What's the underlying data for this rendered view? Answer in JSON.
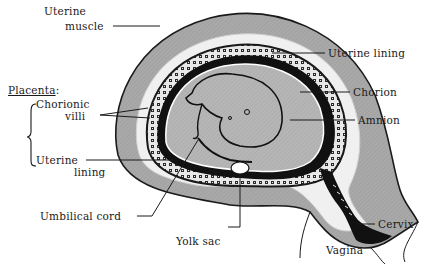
{
  "diagram": {
    "colors": {
      "background": "#ffffff",
      "muscle_gray": "#a8a8a8",
      "lining_white": "#f2f2f2",
      "outline": "#1a1a1a",
      "amniotic_gray": "#b4b4b4"
    },
    "labels": {
      "uterine_muscle_1": "Uterine",
      "uterine_muscle_2": "muscle",
      "uterine_lining_top": "Uterine lining",
      "placenta_heading": "Placenta",
      "placenta_colon": ":",
      "chorionic_villi_1": "Chorionic",
      "chorionic_villi_2": "villi",
      "chorion": "Chorion",
      "amnion": "Amnion",
      "uterine_lining_left_1": "Uterine",
      "uterine_lining_left_2": "lining",
      "umbilical_cord": "Umbilical cord",
      "yolk_sac": "Yolk sac",
      "cervix": "Cervix",
      "vagina": "Vagina"
    }
  }
}
